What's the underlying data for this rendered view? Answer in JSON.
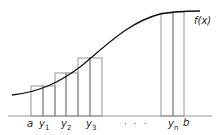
{
  "diagram": {
    "function_label": "f(x)",
    "axis_labels": {
      "a": "a",
      "y1": "y",
      "y1_sub": "1",
      "y2": "y",
      "y2_sub": "2",
      "y3": "y",
      "y3_sub": "3",
      "ellipsis": "· · ·",
      "yn": "y",
      "yn_sub": "n",
      "b": "b"
    },
    "colors": {
      "curve": "#111111",
      "bars": "#777777",
      "axis": "#888888"
    }
  }
}
